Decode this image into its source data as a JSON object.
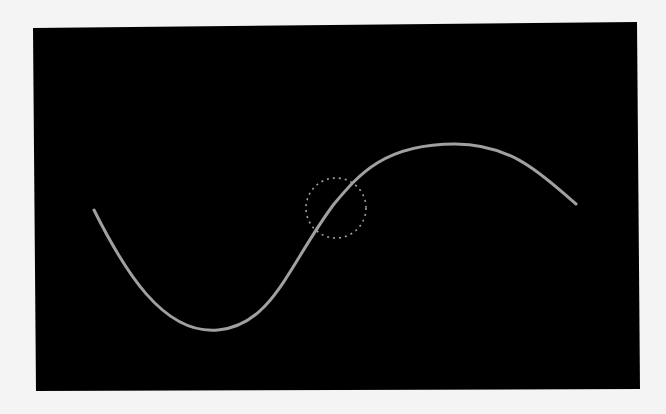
{
  "canvas": {
    "background_color": "#f4f4f4",
    "panel_color": "#000000",
    "panel_corners": [
      [
        33,
        28
      ],
      [
        637,
        22
      ],
      [
        640,
        389
      ],
      [
        36,
        391
      ]
    ]
  },
  "curve": {
    "color": "#a0a0a0",
    "stroke_width": 3,
    "start": [
      94,
      210
    ],
    "trough": [
      218,
      330
    ],
    "kink": [
      334,
      204
    ],
    "peak": [
      455,
      144
    ],
    "end": [
      576,
      204
    ]
  },
  "cursor_circle": {
    "center": [
      336,
      208
    ],
    "radius": 30,
    "color": "#a0a0a0",
    "style": "dashed"
  }
}
